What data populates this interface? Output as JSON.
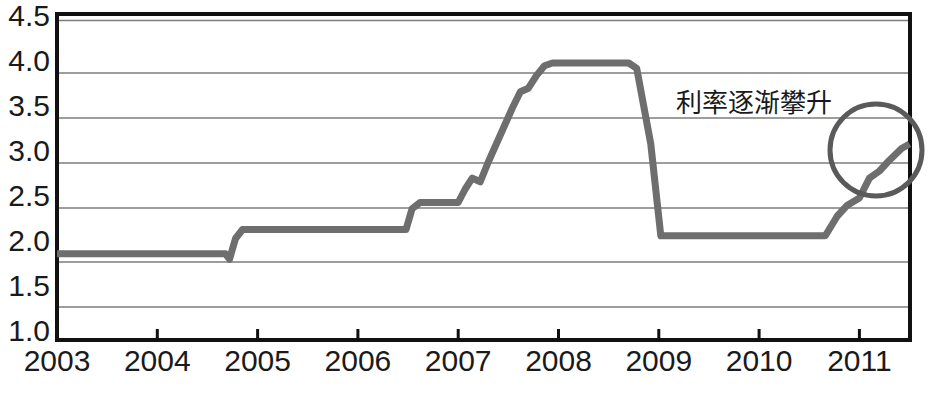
{
  "chart_data": {
    "type": "line",
    "title": "",
    "xlabel": "",
    "ylabel": "",
    "xlim": [
      2003.0,
      2011.5
    ],
    "ylim": [
      1.0,
      4.5
    ],
    "grid": true,
    "legend": false,
    "legend_position": "none",
    "y_ticks": [
      "4.5",
      "4.0",
      "3.5",
      "3.0",
      "2.5",
      "2.0",
      "1.5",
      "1.0"
    ],
    "y_tick_values": [
      4.5,
      4.0,
      3.5,
      3.0,
      2.5,
      2.0,
      1.5,
      1.0
    ],
    "x_ticks": [
      "2003",
      "2004",
      "2005",
      "2006",
      "2007",
      "2008",
      "2009",
      "2010",
      "2011"
    ],
    "x_tick_values": [
      2003,
      2004,
      2005,
      2006,
      2007,
      2008,
      2009,
      2010,
      2011
    ],
    "series": [
      {
        "name": "interest-rate",
        "color": "#6e6e6e",
        "step_style": "staircase",
        "x": [
          2003.0,
          2004.68,
          2004.72,
          2004.78,
          2004.85,
          2006.48,
          2006.54,
          2006.62,
          2007.0,
          2007.07,
          2007.14,
          2007.22,
          2007.3,
          2007.38,
          2007.46,
          2007.54,
          2007.62,
          2007.7,
          2007.78,
          2007.86,
          2007.94,
          2008.02,
          2008.7,
          2008.78,
          2008.92,
          2009.02,
          2010.66,
          2010.78,
          2010.88,
          2011.0,
          2011.1,
          2011.2,
          2011.3,
          2011.42,
          2011.5
        ],
        "y": [
          1.88,
          1.88,
          1.82,
          2.05,
          2.15,
          2.15,
          2.38,
          2.45,
          2.45,
          2.6,
          2.72,
          2.68,
          2.9,
          3.1,
          3.3,
          3.5,
          3.68,
          3.72,
          3.86,
          3.97,
          4.0,
          4.0,
          4.0,
          3.94,
          3.1,
          2.08,
          2.08,
          2.3,
          2.42,
          2.5,
          2.72,
          2.8,
          2.92,
          3.05,
          3.1
        ]
      }
    ],
    "annotations": [
      {
        "name": "rising-rates-note",
        "text": "利率逐渐攀升",
        "x_px": 676,
        "y_px": 104
      },
      {
        "name": "highlight-ellipse",
        "shape": "circle",
        "cx_px": 876,
        "cy_px": 150,
        "r_px": 46
      }
    ]
  },
  "figure": {
    "background": "#ffffff",
    "line_color": "#6e6e6e",
    "grid_color": "#7d7d7d",
    "axis_color": "#111111",
    "text_color": "#1a1a1a"
  }
}
